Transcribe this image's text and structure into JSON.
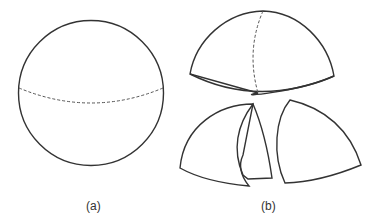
{
  "figure": {
    "panels": [
      {
        "id": "a",
        "label": "(a)",
        "shape": "sphere with dashed equator"
      },
      {
        "id": "b",
        "label": "(b)",
        "shape": "sphere cut into hemisphere and quarter pieces"
      }
    ],
    "stroke_color": "#333333",
    "dash_color": "#555555"
  }
}
